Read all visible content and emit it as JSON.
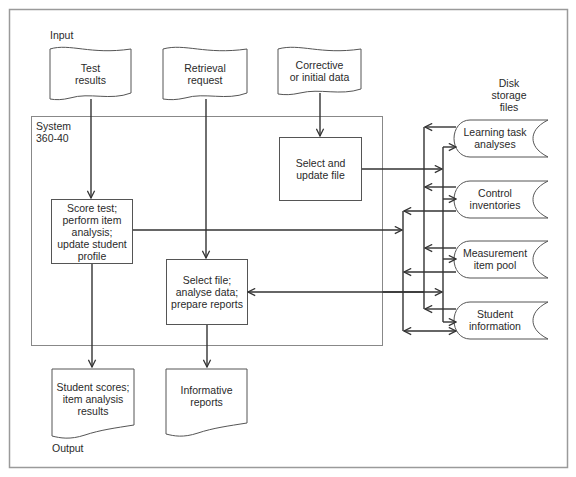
{
  "diagram": {
    "labels": {
      "input": "Input",
      "output": "Output",
      "system_line1": "System",
      "system_line2": "360-40",
      "disk_line1": "Disk",
      "disk_line2": "storage",
      "disk_line3": "files"
    },
    "inputs": [
      {
        "id": "test-results",
        "line1": "Test",
        "line2": "results"
      },
      {
        "id": "retrieval-request",
        "line1": "Retrieval",
        "line2": "request"
      },
      {
        "id": "corrective-data",
        "line1": "Corrective",
        "line2": "or initial data"
      }
    ],
    "processes": [
      {
        "id": "select-update-file",
        "lines": [
          "Select and",
          "update file"
        ]
      },
      {
        "id": "score-test",
        "lines": [
          "Score test;",
          "perform item",
          "analysis;",
          "update student",
          "profile"
        ]
      },
      {
        "id": "select-file-reports",
        "lines": [
          "Select file;",
          "analyse data;",
          "prepare reports"
        ]
      }
    ],
    "outputs": [
      {
        "id": "student-scores",
        "lines": [
          "Student scores;",
          "item analysis",
          "results"
        ]
      },
      {
        "id": "informative-reports",
        "lines": [
          "Informative",
          "reports"
        ]
      }
    ],
    "storage": [
      {
        "id": "learning-task-analyses",
        "line1": "Learning task",
        "line2": "analyses"
      },
      {
        "id": "control-inventories",
        "line1": "Control",
        "line2": "inventories"
      },
      {
        "id": "measurement-item-pool",
        "line1": "Measurement",
        "line2": "item pool"
      },
      {
        "id": "student-information",
        "line1": "Student",
        "line2": "information"
      }
    ],
    "colors": {
      "line": "#333333",
      "frame": "#9a9a9a",
      "box": "#555555"
    }
  }
}
